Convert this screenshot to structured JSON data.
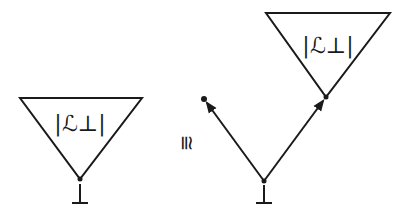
{
  "diagram": {
    "type": "tree-isomorphism",
    "left": {
      "triangle_label": "|ℒ⊥|",
      "root_label": "⊥"
    },
    "relation": "≅",
    "right": {
      "triangle_label": "|ℒ⊥|",
      "root_label": "⊥",
      "branches": [
        "left-leaf-arrow",
        "right-subtree-arrow"
      ]
    },
    "colors": {
      "stroke": "#1a1a1a",
      "background": "#ffffff"
    }
  }
}
